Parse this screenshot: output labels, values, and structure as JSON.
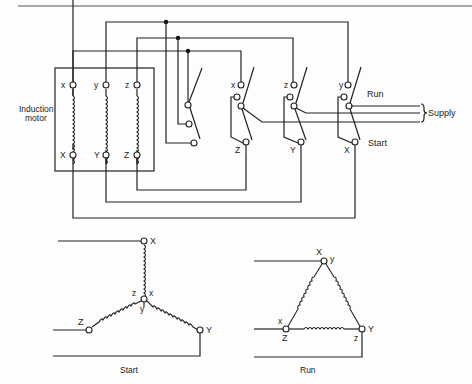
{
  "diagram": {
    "motor": {
      "label_line1": "Induction",
      "label_line2": "motor",
      "top_terminals": [
        "x",
        "y",
        "z"
      ],
      "bottom_terminals": [
        "X",
        "Y",
        "Z"
      ]
    },
    "switches": [
      {
        "top": "x",
        "bottom": "Z"
      },
      {
        "top": "z",
        "bottom": "Y"
      },
      {
        "top": "y",
        "bottom": "X"
      }
    ],
    "switch_positions": {
      "run": "Run",
      "start": "Start"
    },
    "supply_label": "Supply",
    "star": {
      "caption": "Start",
      "nodes": {
        "top": "X",
        "center_z": "z",
        "center_x": "x",
        "center_y": "y",
        "left": "Z",
        "right": "Y"
      }
    },
    "delta": {
      "caption": "Run",
      "nodes": {
        "top_X": "X",
        "top_y": "y",
        "left_x": "x",
        "left_Z": "Z",
        "right_Y": "Y",
        "right_z": "z"
      }
    }
  }
}
